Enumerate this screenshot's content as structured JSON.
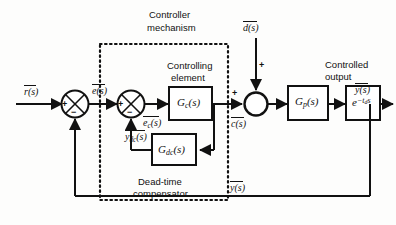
{
  "figure": {
    "type": "control-block-diagram",
    "background": "#fdfdfc",
    "line_color": "#111111"
  },
  "annotations": {
    "controller_mechanism_line1": "Controller",
    "controller_mechanism_line2": "mechanism",
    "controlling_element_line1": "Controlling",
    "controlling_element_line2": "element",
    "dead_time_comp_line1": "Dead-time",
    "dead_time_comp_line2": "compensator",
    "controlled_output_line1": "Controlled",
    "controlled_output_line2": "output"
  },
  "signals": {
    "reference": "r(s)",
    "error": "e(s)",
    "controller_error": "e",
    "controller_error_sub": "c",
    "controller_error_tail": "(s)",
    "dead_time_feedback": "y",
    "dead_time_feedback_sub": "dc",
    "dead_time_feedback_tail": "(s)",
    "controller_output": "c(s)",
    "disturbance": "d(s)",
    "output_top": "y(s)",
    "output_feedback": "y(s)"
  },
  "blocks": [
    {
      "id": "controlling-element",
      "main": "G",
      "sub": "c",
      "tail": "(s)"
    },
    {
      "id": "dead-time-compensator",
      "main": "G",
      "sub": "dc",
      "tail": "(s)"
    },
    {
      "id": "process",
      "main": "G",
      "sub": "p",
      "tail": "(s)"
    },
    {
      "id": "time-delay",
      "main": "e",
      "exp_minus": "−",
      "exp_t": "t",
      "exp_sub": "d",
      "exp_s": "s"
    }
  ],
  "summing_junctions": [
    {
      "id": "error-junction",
      "signs": {
        "left": "+",
        "bottom": "−"
      },
      "style": "crossed"
    },
    {
      "id": "controller-junction",
      "signs": {
        "left": "+",
        "bottom": "−"
      },
      "style": "crossed"
    },
    {
      "id": "disturbance-junction",
      "signs": {
        "left": "+",
        "top": "+"
      },
      "style": "plain"
    }
  ]
}
